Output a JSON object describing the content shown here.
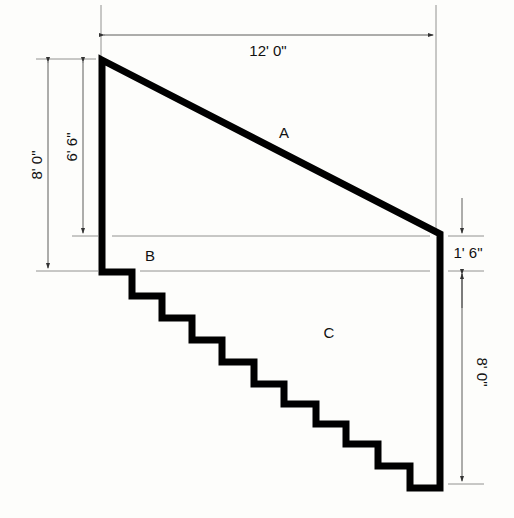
{
  "diagram": {
    "type": "stair wall elevation with dimensions",
    "regions": [
      {
        "id": "A",
        "label": "A",
        "description": "sloped triangle above stringer line"
      },
      {
        "id": "B",
        "label": "B",
        "description": "horizontal band between dimension lines"
      },
      {
        "id": "C",
        "label": "C",
        "description": "area above stair steps"
      }
    ],
    "dimensions": {
      "top_width": "12' 0\"",
      "left_overall_height": "8' 0\"",
      "left_upper_height": "6' 6\"",
      "right_offset": "1' 6\"",
      "right_lower_height": "8' 0\""
    },
    "colors": {
      "outline": "#000000",
      "dimension_line": "#555555",
      "background": "#fdfdfb"
    }
  }
}
